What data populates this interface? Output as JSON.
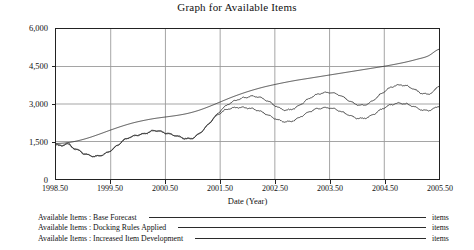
{
  "chart_data": {
    "type": "line",
    "title": "Graph for Available Items",
    "xlabel": "Date (Year)",
    "ylabel": "",
    "unit": "items",
    "xlim": [
      1998.5,
      2005.5
    ],
    "ylim": [
      0,
      6000
    ],
    "grid": true,
    "legend_position": "below",
    "xticks": [
      "1998.50",
      "1999.50",
      "2000.50",
      "2001.50",
      "2002.50",
      "2003.50",
      "2004.50",
      "2005.50"
    ],
    "xtick_values": [
      1998.5,
      1999.5,
      2000.5,
      2001.5,
      2002.5,
      2003.5,
      2004.5,
      2005.5
    ],
    "yticks": [
      "0",
      "1,500",
      "3,000",
      "4,500",
      "6,000"
    ],
    "ytick_values": [
      0,
      1500,
      3000,
      4500,
      6000
    ],
    "series": [
      {
        "name": "Available Items : Base Forecast",
        "unit": "items",
        "color": "#2b2b2b",
        "x": [
          1998.5,
          1998.7,
          1998.9,
          1999.1,
          1999.3,
          1999.5,
          1999.7,
          1999.9,
          2000.1,
          2000.3,
          2000.5,
          2000.7,
          2000.9,
          2001.1,
          2001.3,
          2001.5,
          2001.7,
          2001.9,
          2002.1,
          2002.3,
          2002.5,
          2002.7,
          2002.9,
          2003.1,
          2003.3,
          2003.5,
          2003.7,
          2003.9,
          2004.1,
          2004.3,
          2004.5,
          2004.7,
          2004.9,
          2005.1,
          2005.3,
          2005.5
        ],
        "y": [
          1420,
          1450,
          1530,
          1650,
          1800,
          1960,
          2110,
          2240,
          2340,
          2420,
          2480,
          2540,
          2620,
          2740,
          2900,
          3080,
          3260,
          3420,
          3560,
          3680,
          3780,
          3870,
          3950,
          4020,
          4090,
          4160,
          4230,
          4300,
          4370,
          4440,
          4510,
          4590,
          4680,
          4790,
          4920,
          5190
        ]
      },
      {
        "name": "Available Items : Docking Rules Applied",
        "unit": "items",
        "color": "#2b2b2b",
        "x": [
          1998.5,
          1998.6,
          1998.7,
          1998.8,
          1998.9,
          1999.0,
          1999.1,
          1999.2,
          1999.3,
          1999.4,
          1999.5,
          1999.6,
          1999.7,
          1999.8,
          1999.9,
          2000.0,
          2000.1,
          2000.2,
          2000.3,
          2000.4,
          2000.5,
          2000.6,
          2000.7,
          2000.8,
          2000.9,
          2001.0,
          2001.1,
          2001.2,
          2001.3,
          2001.4,
          2001.5,
          2001.6,
          2001.7,
          2001.8,
          2001.9,
          2002.0,
          2002.1,
          2002.2,
          2002.3,
          2002.4,
          2002.5,
          2002.6,
          2002.7,
          2002.8,
          2002.9,
          2003.0,
          2003.1,
          2003.2,
          2003.3,
          2003.4,
          2003.5,
          2003.6,
          2003.7,
          2003.8,
          2003.9,
          2004.0,
          2004.1,
          2004.2,
          2004.3,
          2004.4,
          2004.5,
          2004.6,
          2004.7,
          2004.8,
          2004.9,
          2005.0,
          2005.1,
          2005.2,
          2005.3,
          2005.4,
          2005.5
        ],
        "y": [
          1400,
          1300,
          1420,
          1250,
          1150,
          1020,
          950,
          900,
          930,
          1010,
          1130,
          1300,
          1480,
          1620,
          1700,
          1760,
          1800,
          1870,
          1930,
          1900,
          1840,
          1780,
          1720,
          1650,
          1600,
          1640,
          1780,
          1980,
          2220,
          2480,
          2720,
          2920,
          3060,
          3160,
          3230,
          3280,
          3310,
          3280,
          3200,
          3080,
          2940,
          2820,
          2760,
          2780,
          2880,
          3030,
          3180,
          3310,
          3400,
          3450,
          3460,
          3420,
          3330,
          3210,
          3080,
          2980,
          2950,
          3010,
          3150,
          3330,
          3500,
          3640,
          3730,
          3760,
          3730,
          3640,
          3520,
          3420,
          3400,
          3500,
          3740
        ]
      },
      {
        "name": "Available Items : Increased Item Development",
        "unit": "items",
        "color": "#2b2b2b",
        "x": [
          1998.5,
          1998.6,
          1998.7,
          1998.8,
          1998.9,
          1999.0,
          1999.1,
          1999.2,
          1999.3,
          1999.4,
          1999.5,
          1999.6,
          1999.7,
          1999.8,
          1999.9,
          2000.0,
          2000.1,
          2000.2,
          2000.3,
          2000.4,
          2000.5,
          2000.6,
          2000.7,
          2000.8,
          2000.9,
          2001.0,
          2001.1,
          2001.2,
          2001.3,
          2001.4,
          2001.5,
          2001.6,
          2001.7,
          2001.8,
          2001.9,
          2002.0,
          2002.1,
          2002.2,
          2002.3,
          2002.4,
          2002.5,
          2002.6,
          2002.7,
          2002.8,
          2002.9,
          2003.0,
          2003.1,
          2003.2,
          2003.3,
          2003.4,
          2003.5,
          2003.6,
          2003.7,
          2003.8,
          2003.9,
          2004.0,
          2004.1,
          2004.2,
          2004.3,
          2004.4,
          2004.5,
          2004.6,
          2004.7,
          2004.8,
          2004.9,
          2005.0,
          2005.1,
          2005.2,
          2005.3,
          2005.4,
          2005.5
        ],
        "y": [
          1430,
          1320,
          1440,
          1270,
          1170,
          1040,
          960,
          910,
          940,
          1020,
          1140,
          1310,
          1490,
          1630,
          1710,
          1770,
          1810,
          1880,
          1940,
          1910,
          1850,
          1790,
          1730,
          1660,
          1610,
          1650,
          1790,
          1990,
          2230,
          2460,
          2640,
          2760,
          2830,
          2860,
          2860,
          2840,
          2800,
          2730,
          2640,
          2530,
          2420,
          2330,
          2290,
          2310,
          2400,
          2530,
          2660,
          2760,
          2820,
          2850,
          2840,
          2790,
          2710,
          2610,
          2510,
          2440,
          2420,
          2470,
          2580,
          2720,
          2850,
          2950,
          3010,
          3030,
          3000,
          2930,
          2840,
          2760,
          2740,
          2810,
          2920
        ]
      }
    ]
  },
  "axes": {
    "x_title": "Date (Year)"
  },
  "legend": {
    "rows": [
      {
        "label": "Available Items : Base Forecast",
        "unit": "items"
      },
      {
        "label": "Available Items : Docking Rules Applied",
        "unit": "items"
      },
      {
        "label": "Available Items : Increased Item Development",
        "unit": "items"
      }
    ]
  },
  "colors": {
    "line": "#2b2b2b",
    "grid": "#9a9a9a",
    "frame": "#222222",
    "background": "#ffffff"
  }
}
